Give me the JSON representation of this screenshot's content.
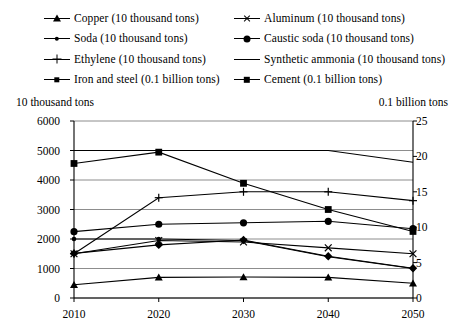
{
  "legend": {
    "entries": [
      {
        "label": "Copper (10 thousand tons)",
        "marker": "triangle-marker",
        "column": "left"
      },
      {
        "label": "Aluminum (10 thousand tons)",
        "marker": "x-marker",
        "column": "right"
      },
      {
        "label": "Soda (10 thousand tons)",
        "marker": "small-dot-marker",
        "column": "left"
      },
      {
        "label": "Caustic soda (10 thousand tons)",
        "marker": "large-dot-marker",
        "column": "right"
      },
      {
        "label": "Ethylene (10 thousand tons)",
        "marker": "plus-marker",
        "column": "left"
      },
      {
        "label": "Synthetic ammonia (10 thousand tons)",
        "marker": "line-only-marker",
        "column": "right"
      },
      {
        "label": "Iron and steel (0.1 billion tons)",
        "marker": "diamond-marker",
        "column": "left"
      },
      {
        "label": "Cement (0.1 billion tons)",
        "marker": "square-marker",
        "column": "right"
      }
    ]
  },
  "axes": {
    "left_unit": "10 thousand tons",
    "right_unit": "0.1 billion tons",
    "left_ticks": [
      "6000",
      "5000",
      "4000",
      "3000",
      "2000",
      "1000",
      "0"
    ],
    "right_ticks": [
      "25",
      "20",
      "15",
      "10",
      "5",
      "0"
    ]
  },
  "chart_data": {
    "type": "line",
    "title": "",
    "xlabel": "",
    "ylabel": "10 thousand tons",
    "y2label": "0.1 billion tons",
    "x": [
      2010,
      2020,
      2030,
      2040,
      2050
    ],
    "categories": [
      "2010",
      "2020",
      "2030",
      "2040",
      "2050"
    ],
    "ylim": [
      0,
      6000
    ],
    "y2lim": [
      0,
      25
    ],
    "yticks": [
      0,
      1000,
      2000,
      3000,
      4000,
      5000,
      6000
    ],
    "y2ticks": [
      0,
      5,
      10,
      15,
      20,
      25
    ],
    "grid": true,
    "legend_position": "top",
    "series": [
      {
        "name": "Copper (10 thousand tons)",
        "axis": "left",
        "marker": "triangle",
        "values": [
          450,
          700,
          710,
          700,
          500
        ]
      },
      {
        "name": "Aluminum (10 thousand tons)",
        "axis": "left",
        "marker": "x",
        "values": [
          1500,
          1950,
          1900,
          1700,
          1500
        ]
      },
      {
        "name": "Soda (10 thousand tons)",
        "axis": "left",
        "marker": "small-dot",
        "values": [
          2000,
          2000,
          1950,
          1400,
          1000
        ]
      },
      {
        "name": "Caustic soda (10 thousand tons)",
        "axis": "left",
        "marker": "large-dot",
        "values": [
          2250,
          2500,
          2550,
          2600,
          2350
        ]
      },
      {
        "name": "Ethylene (10 thousand tons)",
        "axis": "left",
        "marker": "plus",
        "values": [
          1500,
          3400,
          3600,
          3600,
          3300
        ]
      },
      {
        "name": "Synthetic ammonia (10 thousand tons)",
        "axis": "left",
        "marker": "none",
        "values": [
          5000,
          5000,
          5000,
          5000,
          4600
        ]
      },
      {
        "name": "Iron and steel (0.1 billion tons)",
        "axis": "right",
        "marker": "diamond",
        "values": [
          6.3,
          7.5,
          8.2,
          5.9,
          4.2
        ]
      },
      {
        "name": "Cement (0.1 billion tons)",
        "axis": "right",
        "marker": "square",
        "values": [
          19.0,
          20.6,
          16.2,
          12.5,
          9.4
        ]
      }
    ]
  }
}
